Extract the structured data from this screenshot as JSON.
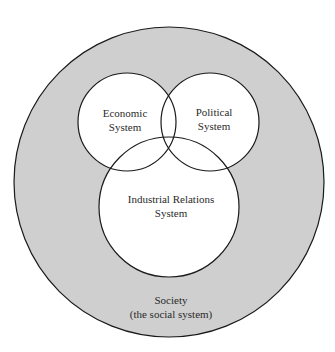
{
  "diagram": {
    "type": "nested-venn",
    "colors": {
      "background": "#ffffff",
      "society_fill": "#cfcfcf",
      "inner_fill": "#ffffff",
      "stroke": "#1a1a1a",
      "text": "#2a2a2a"
    },
    "society": {
      "line1": "Society",
      "line2": "(the social system)"
    },
    "economic": {
      "line1": "Economic",
      "line2": "System"
    },
    "political": {
      "line1": "Political",
      "line2": "System"
    },
    "industrial": {
      "line1": "Industrial Relations",
      "line2": "System"
    }
  }
}
